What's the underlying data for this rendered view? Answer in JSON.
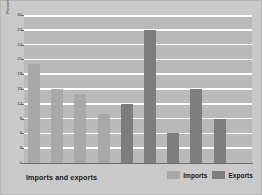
{
  "chart_data": {
    "type": "bar",
    "title": "Imports and exports",
    "xlabel": "",
    "ylabel": "Percentage of total",
    "ylim": [
      0,
      30
    ],
    "ytick_step": 3,
    "yticks": [
      0,
      3,
      6,
      9,
      12,
      15,
      18,
      21,
      24,
      27,
      30
    ],
    "ytick_labels": [
      "0",
      "3",
      "6",
      "9",
      "12",
      "15",
      "18",
      "21",
      "24",
      "27",
      "30"
    ],
    "grid": true,
    "grid_orientation": "horizontal",
    "legend_position": "bottom-right",
    "categories": [
      "Capital goods",
      "Crude oil",
      "Consumer goods",
      "Food, beverages, and tobacco",
      "Sulfur",
      "Phosphoric acid",
      "Phosphate",
      "Clothing"
    ],
    "series": [
      {
        "name": "Imports",
        "color": "#a8a8a8",
        "values": [
          20,
          15,
          14,
          10,
          null,
          null,
          null,
          null
        ]
      },
      {
        "name": "Exports",
        "color": "#7d7d7d",
        "values": [
          null,
          null,
          null,
          12,
          27,
          6,
          15,
          9
        ]
      }
    ],
    "bars": [
      {
        "category": "Capital goods",
        "series": "Imports",
        "value": 20
      },
      {
        "category": "Crude oil",
        "series": "Imports",
        "value": 15
      },
      {
        "category": "Consumer goods",
        "series": "Imports",
        "value": 14
      },
      {
        "category": "Food, beverages, and tobacco",
        "series": "Imports",
        "value": 10
      },
      {
        "category": "Food, beverages, and tobacco",
        "series": "Exports",
        "value": 12
      },
      {
        "category": "Sulfur",
        "series": "Exports",
        "value": 27
      },
      {
        "category": "Phosphoric acid",
        "series": "Exports",
        "value": 6
      },
      {
        "category": "Phosphate",
        "series": "Exports",
        "value": 15
      },
      {
        "category": "Clothing",
        "series": "Exports",
        "value": 9
      }
    ]
  },
  "legend": {
    "items": [
      {
        "label": "Imports",
        "color": "#a8a8a8"
      },
      {
        "label": "Exports",
        "color": "#7d7d7d"
      }
    ]
  },
  "colors": {
    "figure_background": "#c9c9c9",
    "plot_background": "#b9b9b9",
    "gridline": "#ffffff",
    "axis": "#6e6e6e",
    "imports": "#a8a8a8",
    "exports": "#7d7d7d",
    "text": "#1a1a1a"
  }
}
